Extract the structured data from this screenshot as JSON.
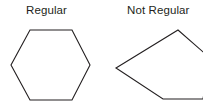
{
  "figure": {
    "background_color": "#ffffff",
    "stroke_color": "#231f20",
    "text_color": "#231f20",
    "width": 203,
    "height": 108
  },
  "labels": {
    "left": "Regular",
    "right": "Not Regular"
  },
  "shapes": {
    "regular_hexagon": {
      "name": "regular-hexagon",
      "sides": 6,
      "is_regular": true,
      "points": "30,30 72,30 90,65 72,100 30,100 11,65"
    },
    "irregular_polygon": {
      "name": "irregular-polygon",
      "sides": 5,
      "is_regular": false,
      "points": "116,68 178,30 210,58 203,99 163,99"
    }
  }
}
